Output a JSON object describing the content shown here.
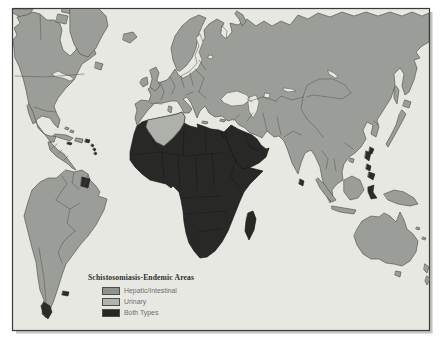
{
  "map": {
    "legend": {
      "title": "Schistosomiasis-Endemic Areas",
      "items": [
        {
          "id": "hepatic-intestinal",
          "label": "Hepatic/Intestinal",
          "color": "#8f928c"
        },
        {
          "id": "urinary",
          "label": "Urinary",
          "color": "#b1b3ad"
        },
        {
          "id": "both-types",
          "label": "Both Types",
          "color": "#262624"
        }
      ]
    },
    "colors": {
      "background": "#ffffff",
      "ocean": "#e8e8e3",
      "land": "#9b9e98",
      "land_border": "#50514c",
      "endemic_both": "#282826",
      "endemic_both_border": "#131312",
      "endemic_urinary": "#aeb0aa",
      "dark_focus": "#2c2c2a",
      "frame_border": "#3a3a38",
      "scan_shadow": "#c2c2be",
      "legend_title_text": "#2e2e2c",
      "legend_label_text": "#6d6d6b"
    },
    "regions": {
      "both_types": [
        "Africa",
        "Arabian Peninsula",
        "Madagascar"
      ],
      "urinary": [
        "Algeria / Tunisia"
      ],
      "dark_island_foci": [
        "Philippines",
        "Sulawesi",
        "Taiwan",
        "Sri Lanka",
        "Suriname",
        "Lesser Antilles",
        "Falkland Islands",
        "Tierra del Fuego"
      ]
    }
  }
}
